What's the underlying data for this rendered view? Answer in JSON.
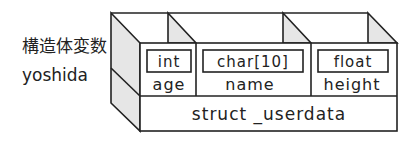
{
  "labels": {
    "type_label": "構造体変数",
    "variable_name": "yoshida"
  },
  "struct": {
    "name": "struct _userdata",
    "members": [
      {
        "type": "int",
        "name": "age"
      },
      {
        "type": "char[10]",
        "name": "name"
      },
      {
        "type": "float",
        "name": "height"
      }
    ]
  },
  "colors": {
    "line": "#222222",
    "shade": "#e6e6e6",
    "background": "#ffffff"
  }
}
